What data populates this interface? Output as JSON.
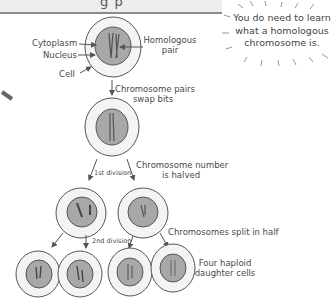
{
  "title": {
    "partial_text": "g p"
  },
  "callout": {
    "line1": "You do need to learn",
    "line2": "what a homologous",
    "line3": "chromosome is."
  },
  "labels": {
    "cytoplasm": "Cytoplasm",
    "nucleus": "Nucleus",
    "cell": "Cell",
    "homologous_pair_1": "Homologous",
    "homologous_pair_2": "pair",
    "swap_1": "Chromosome pairs",
    "swap_2": "swap bits",
    "first_division": "1st division",
    "halved_1": "Chromosome number",
    "halved_2": "is halved",
    "second_division": "2nd division",
    "split": "Chromosomes split in half",
    "daughter_1": "Four haploid",
    "daughter_2": "daughter cells"
  },
  "colors": {
    "nucleus_fill": "#a8a8a8",
    "cytoplasm_fill": "#f2f2f2",
    "line": "#555555",
    "title_bar": "#eeeeee",
    "title_rule": "#8c8c8c"
  }
}
